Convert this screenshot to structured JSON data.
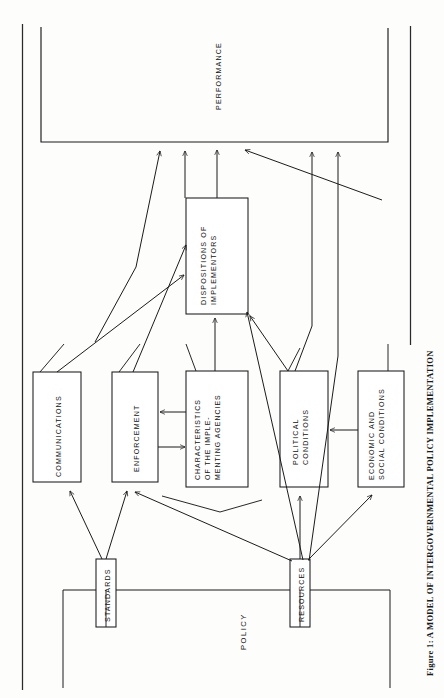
{
  "figure": {
    "caption": "Figure 1: A MODEL OF INTERGOVERNMENTAL POLICY IMPLEMENTATION",
    "orientation": "rotated-90-ccw",
    "page_rule_color": "#2a2a2a"
  },
  "diagram": {
    "title": "A MODEL OF INTERGOVERNMENTAL POLICY IMPLEMENTATION",
    "free_label_policy": "POLICY",
    "boxes": [
      {
        "id": "performance",
        "label_lines": [
          "PERFORMANCE"
        ]
      },
      {
        "id": "dispositions",
        "label_lines": [
          "DISPOSITIONS OF",
          "IMPLEMENTORS"
        ]
      },
      {
        "id": "communications",
        "label_lines": [
          "COMMUNICATIONS"
        ]
      },
      {
        "id": "enforcement",
        "label_lines": [
          "ENFORCEMENT"
        ]
      },
      {
        "id": "characteristics",
        "label_lines": [
          "CHARACTERISTICS",
          "OF THE IMPLE-",
          "MENTING AGENCIES"
        ]
      },
      {
        "id": "political",
        "label_lines": [
          "POLITICAL",
          "CONDITIONS"
        ]
      },
      {
        "id": "economic",
        "label_lines": [
          "ECONOMIC AND",
          "SOCIAL CONDITIONS"
        ]
      },
      {
        "id": "standards",
        "label_lines": [
          "STANDARDS"
        ]
      },
      {
        "id": "resources",
        "label_lines": [
          "RESOURCES"
        ]
      }
    ],
    "edges": [
      {
        "from": "policy",
        "to": "standards",
        "kind": "bracket"
      },
      {
        "from": "policy",
        "to": "resources",
        "kind": "bracket"
      },
      {
        "from": "standards",
        "to": "communications",
        "kind": "arrow"
      },
      {
        "from": "standards",
        "to": "enforcement",
        "kind": "arrow"
      },
      {
        "from": "resources",
        "to": "enforcement",
        "kind": "arrow"
      },
      {
        "from": "resources",
        "to": "political",
        "kind": "arrow"
      },
      {
        "from": "resources",
        "to": "economic",
        "kind": "arrow"
      },
      {
        "from": "resources",
        "to": "dispositions",
        "kind": "arrow"
      },
      {
        "from": "resources",
        "to": "performance",
        "kind": "arrow"
      },
      {
        "from": "characteristics",
        "to": "enforcement",
        "kind": "arrow"
      },
      {
        "from": "enforcement",
        "to": "characteristics",
        "kind": "arrow"
      },
      {
        "from": "characteristics",
        "to": "dispositions",
        "kind": "arrow"
      },
      {
        "from": "characteristics",
        "to": "performance",
        "kind": "arrow"
      },
      {
        "from": "economic",
        "to": "political",
        "kind": "arrow"
      },
      {
        "from": "political",
        "to": "dispositions",
        "kind": "arrow"
      },
      {
        "from": "political",
        "to": "performance",
        "kind": "arrow"
      },
      {
        "from": "communications",
        "to": "dispositions",
        "kind": "arrow"
      },
      {
        "from": "dispositions",
        "to": "performance",
        "kind": "arrow"
      }
    ]
  }
}
